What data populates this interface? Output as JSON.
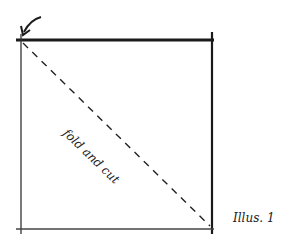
{
  "diagram": {
    "fold_label": "fold and cut",
    "caption": "Illus. 1",
    "square": {
      "x1": 21,
      "y1": 40,
      "x2": 212,
      "y2": 229
    },
    "stroke_color": "#1a1a1a",
    "arrow_icon": "curved-arrow-icon"
  }
}
